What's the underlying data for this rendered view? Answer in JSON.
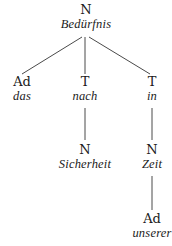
{
  "diagram": {
    "type": "dependency-tree",
    "nodes": {
      "root": {
        "category": "N",
        "word": "Bedürfnis"
      },
      "das": {
        "category": "Ad",
        "word": "das"
      },
      "nach": {
        "category": "T",
        "word": "nach"
      },
      "in": {
        "category": "T",
        "word": "in"
      },
      "sicherheit": {
        "category": "N",
        "word": "Sicherheit"
      },
      "zeit": {
        "category": "N",
        "word": "Zeit"
      },
      "unserer": {
        "category": "Ad",
        "word": "unserer"
      }
    },
    "edges": [
      [
        "root",
        "das"
      ],
      [
        "root",
        "nach"
      ],
      [
        "root",
        "in"
      ],
      [
        "nach",
        "sicherheit"
      ],
      [
        "in",
        "zeit"
      ],
      [
        "zeit",
        "unserer"
      ]
    ],
    "line_color": "#4a4a4a",
    "text_color": "#1a1a1a"
  }
}
